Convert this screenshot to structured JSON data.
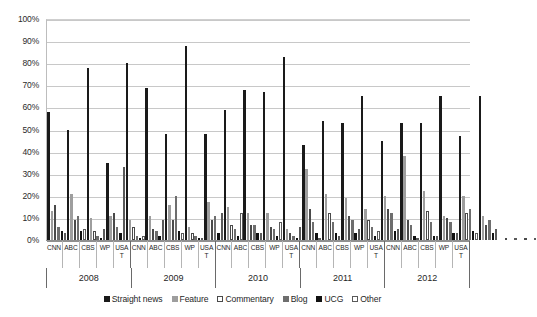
{
  "chart_data": {
    "type": "bar",
    "title": "",
    "xlabel": "",
    "ylabel": "",
    "ylim": [
      0,
      100
    ],
    "grid": true,
    "legend_position": "bottom",
    "tick_labels": [
      "0%",
      "10%",
      "20%",
      "30%",
      "40%",
      "50%",
      "60%",
      "70%",
      "80%",
      "90%",
      "100%"
    ],
    "years": [
      "2008",
      "2009",
      "2010",
      "2011",
      "2012"
    ],
    "outlets": [
      "CNN",
      "ABC",
      "CBS",
      "WP",
      "USA T"
    ],
    "categories": [
      "2008 CNN",
      "2008 ABC",
      "2008 CBS",
      "2008 WP",
      "2008 USA T",
      "2009 CNN",
      "2009 ABC",
      "2009 CBS",
      "2009 WP",
      "2009 USA T",
      "2010 CNN",
      "2010 ABC",
      "2010 CBS",
      "2010 WP",
      "2010 USA T",
      "2011 CNN",
      "2011 ABC",
      "2011 CBS",
      "2011 WP",
      "2011 USA T",
      "2012 CNN",
      "2012 ABC",
      "2012 CBS",
      "2012 WP",
      "2012 USA T"
    ],
    "series": [
      {
        "name": "Straight news",
        "color": "#1a1a1a",
        "values": [
          58,
          50,
          78,
          35,
          80,
          69,
          48,
          88,
          48,
          59,
          68,
          67,
          83,
          43,
          54,
          53,
          65,
          45,
          53,
          53,
          65,
          47,
          65,
          0,
          0
        ]
      },
      {
        "name": "Feature",
        "color": "#9e9e9e",
        "values": [
          13,
          21,
          10,
          11,
          9,
          11,
          16,
          6,
          17,
          15,
          12,
          12,
          5,
          32,
          21,
          19,
          14,
          20,
          38,
          22,
          11,
          20,
          11,
          0,
          0
        ]
      },
      {
        "name": "Commentary",
        "color": "#ffffff",
        "values": [
          16,
          9,
          4,
          12,
          6,
          5,
          9,
          3,
          9,
          7,
          7,
          6,
          3,
          14,
          12,
          11,
          9,
          14,
          9,
          13,
          10,
          12,
          7,
          0,
          0
        ]
      },
      {
        "name": "Blog",
        "color": "#6e6e6e",
        "values": [
          6,
          11,
          2,
          6,
          2,
          4,
          20,
          2,
          11,
          5,
          7,
          5,
          2,
          8,
          8,
          9,
          6,
          12,
          7,
          8,
          8,
          14,
          9,
          0,
          0
        ]
      },
      {
        "name": "UCG",
        "color": "#111111",
        "values": [
          4,
          4,
          1,
          3,
          1,
          2,
          4,
          1,
          3,
          2,
          3,
          2,
          1,
          3,
          3,
          3,
          2,
          4,
          2,
          2,
          3,
          4,
          3,
          0,
          0
        ]
      },
      {
        "name": "Other",
        "color": "#ffffff",
        "values": [
          3,
          5,
          5,
          33,
          2,
          9,
          3,
          0,
          12,
          12,
          3,
          8,
          6,
          0,
          2,
          5,
          4,
          5,
          0,
          2,
          3,
          3,
          5,
          0,
          0
        ]
      }
    ]
  },
  "legend": {
    "items": [
      {
        "label": "Straight news",
        "swatch": "legend-swatch-straight-news"
      },
      {
        "label": "Feature",
        "swatch": "legend-swatch-feature"
      },
      {
        "label": "Commentary",
        "swatch": "legend-swatch-commentary"
      },
      {
        "label": "Blog",
        "swatch": "legend-swatch-blog"
      },
      {
        "label": "UCG",
        "swatch": "legend-swatch-ucg"
      },
      {
        "label": "Other",
        "swatch": "legend-swatch-other"
      }
    ]
  }
}
